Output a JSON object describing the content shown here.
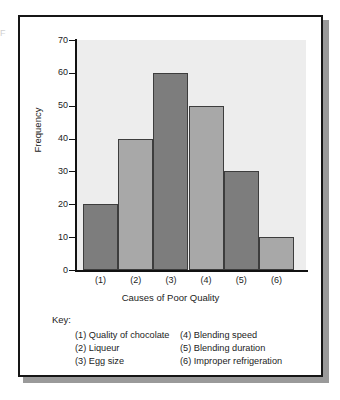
{
  "figure": {
    "edge_artifact": "F",
    "key_label": "Key:"
  },
  "chart_data": {
    "type": "bar",
    "title": "",
    "xlabel": "Causes of Poor Quality",
    "ylabel": "Frequency",
    "categories": [
      "(1)",
      "(2)",
      "(3)",
      "(4)",
      "(5)",
      "(6)"
    ],
    "values": [
      20,
      40,
      60,
      50,
      30,
      10
    ],
    "ylim": [
      0,
      70
    ],
    "yticks": [
      0,
      10,
      20,
      30,
      40,
      50,
      60,
      70
    ],
    "ytick_labels": [
      "0",
      "10",
      "20",
      "30",
      "40",
      "50",
      "60",
      "70"
    ],
    "grid": false,
    "legend_position": "below-plot",
    "bar_colors": [
      "#7d7d7d",
      "#a8a8a8",
      "#7d7d7d",
      "#a8a8a8",
      "#7d7d7d",
      "#a8a8a8"
    ],
    "plot_background": "#ededed",
    "bar_border_color": "#3d3d3d",
    "axis_color": "#111111"
  },
  "key": {
    "left_column": [
      "(1) Quality of chocolate",
      "(2) Liqueur",
      "(3) Egg size"
    ],
    "right_column": [
      "(4) Blending speed",
      "(5) Blending duration",
      "(6) Improper refrigeration"
    ]
  }
}
